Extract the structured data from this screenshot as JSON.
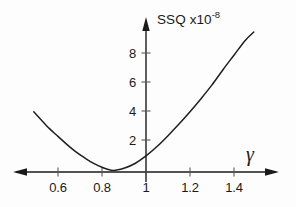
{
  "chart_data": {
    "type": "line",
    "title": "",
    "subtitle": "",
    "xlabel": "γ",
    "ylabel": "SSQ x10",
    "ylabel_text": "SSQ x10",
    "ylabel_exponent": "-8",
    "ylabel_full": "SSQ x10^-8",
    "grid": false,
    "legend": false,
    "legend_position": "none",
    "xlim": [
      0.46,
      1.56
    ],
    "ylim": [
      -0.6,
      9.8
    ],
    "xticks": [
      0.6,
      0.8,
      1,
      1.2,
      1.4
    ],
    "xtick_labels": [
      "0.6",
      "0.8",
      "1",
      "1.2",
      "1.4"
    ],
    "yticks": [
      2,
      4,
      6,
      8
    ],
    "ytick_labels": [
      "2",
      "4",
      "6",
      "8"
    ],
    "axis_arrows": {
      "x_left": true,
      "x_right": true,
      "y_top": true
    },
    "curve_description": "parabola-like SSQ minimum near gamma = 0.85",
    "minimum": {
      "x": 0.85,
      "y": -0.15
    },
    "x": [
      0.49,
      0.52,
      0.56,
      0.6,
      0.64,
      0.68,
      0.72,
      0.76,
      0.8,
      0.85,
      0.9,
      0.95,
      1.0,
      1.05,
      1.1,
      1.15,
      1.2,
      1.25,
      1.3,
      1.35,
      1.4,
      1.45,
      1.49
    ],
    "y": [
      3.95,
      3.45,
      2.8,
      2.25,
      1.7,
      1.2,
      0.78,
      0.4,
      0.12,
      -0.1,
      0.05,
      0.38,
      0.9,
      1.55,
      2.3,
      3.1,
      3.95,
      4.85,
      5.8,
      6.85,
      7.85,
      8.85,
      9.45
    ],
    "series": [
      {
        "name": "SSQ",
        "color": "#1f1f1f",
        "x": [
          0.49,
          0.52,
          0.56,
          0.6,
          0.64,
          0.68,
          0.72,
          0.76,
          0.8,
          0.85,
          0.9,
          0.95,
          1.0,
          1.05,
          1.1,
          1.15,
          1.2,
          1.25,
          1.3,
          1.35,
          1.4,
          1.45,
          1.49
        ],
        "values": [
          3.95,
          3.45,
          2.8,
          2.25,
          1.7,
          1.2,
          0.78,
          0.4,
          0.12,
          -0.1,
          0.05,
          0.38,
          0.9,
          1.55,
          2.3,
          3.1,
          3.95,
          4.85,
          5.8,
          6.85,
          7.85,
          8.85,
          9.45
        ]
      }
    ],
    "colors": {
      "curve": "#1f1f1f",
      "axis": "#1a1a1a",
      "text": "#1a1a1a",
      "background": "#fdfdfd"
    }
  }
}
